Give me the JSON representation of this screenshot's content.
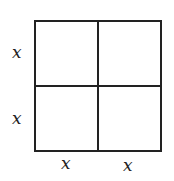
{
  "diagram": {
    "colors": {
      "stroke": "#222222",
      "background": "#ffffff"
    },
    "labels": {
      "left": [
        "x",
        "x"
      ],
      "bottom": [
        "x",
        "x"
      ]
    }
  }
}
